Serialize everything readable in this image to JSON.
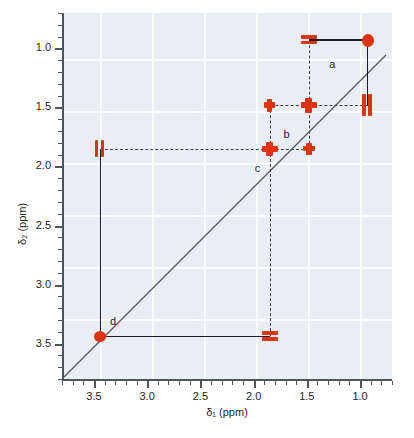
{
  "figure": {
    "type": "cosy-2d-nmr-spectrum",
    "xlabel": "δ₁ (ppm)",
    "ylabel": "δ₂ (ppm)",
    "colors": {
      "peak": "#dd3311",
      "background": "#e9eef4",
      "grid": "#fbfcfe",
      "axis": "#4d545b",
      "line": "#1b1b27"
    }
  },
  "axes": {
    "x": {
      "label": "δ₁ (ppm)",
      "min": 3.8,
      "max": 0.7,
      "inverted": true,
      "ticks": [
        "3.5",
        "3.0",
        "2.5",
        "2.0",
        "1.5",
        "1.0"
      ],
      "tick_values": [
        3.5,
        3.0,
        2.5,
        2.0,
        1.5,
        1.0
      ],
      "minor_step": 0.1
    },
    "y": {
      "label": "δ₂ (ppm)",
      "min": 0.7,
      "max": 3.8,
      "inverted": true,
      "ticks": [
        "1.0",
        "1.5",
        "2.0",
        "2.5",
        "3.0",
        "3.5"
      ],
      "tick_values": [
        1.0,
        1.5,
        2.0,
        2.5,
        3.0,
        3.5
      ],
      "minor_step": 0.1
    }
  },
  "chart_data": {
    "type": "scatter",
    "title": "",
    "xlabel": "δ₁ (ppm)",
    "ylabel": "δ₂ (ppm)",
    "xlim": [
      3.8,
      0.7
    ],
    "ylim": [
      0.7,
      3.8
    ],
    "grid": true,
    "legend": "none",
    "diagonal_line": true,
    "diagonal_from": [
      3.8,
      3.8
    ],
    "diagonal_to": [
      0.7,
      0.7
    ],
    "diagonal_peaks": [
      {
        "id": "dp-093",
        "x": 0.93,
        "y": 0.93,
        "shape": "blob",
        "w": 12,
        "h": 13
      },
      {
        "id": "dp-148",
        "x": 1.48,
        "y": 1.48,
        "shape": "star",
        "w": 16,
        "h": 15
      },
      {
        "id": "dp-185",
        "x": 1.85,
        "y": 1.85,
        "shape": "star",
        "w": 16,
        "h": 14
      },
      {
        "id": "dp-344",
        "x": 3.44,
        "y": 3.44,
        "shape": "blob",
        "w": 12,
        "h": 11
      }
    ],
    "cross_peaks": [
      {
        "id": "cp-148-093",
        "x": 1.48,
        "y": 0.93,
        "shape": "bars-h",
        "w": 16,
        "h": 10
      },
      {
        "id": "cp-093-148",
        "x": 0.93,
        "y": 1.48,
        "shape": "bars-v",
        "w": 11,
        "h": 22
      },
      {
        "id": "cp-185-148",
        "x": 1.85,
        "y": 1.48,
        "shape": "star-sm",
        "w": 11,
        "h": 13
      },
      {
        "id": "cp-148-185",
        "x": 1.48,
        "y": 1.85,
        "shape": "star-sm",
        "w": 12,
        "h": 12
      },
      {
        "id": "cp-344-185",
        "x": 3.44,
        "y": 1.85,
        "shape": "bars-v",
        "w": 11,
        "h": 17
      },
      {
        "id": "cp-185-344",
        "x": 1.85,
        "y": 3.44,
        "shape": "bars-h",
        "w": 16,
        "h": 10
      }
    ],
    "couplings": [
      {
        "label": "a",
        "between": [
          0.93,
          1.48
        ],
        "label_x": 1.29,
        "label_y": 1.08
      },
      {
        "label": "b",
        "between": [
          1.48,
          1.85
        ],
        "label_x": 1.72,
        "label_y": 1.67
      },
      {
        "label": "c",
        "between": [
          1.85,
          1.85
        ],
        "label_x": 1.99,
        "label_y": 1.96
      },
      {
        "label": "d",
        "between": [
          1.85,
          3.44
        ],
        "label_x": 3.35,
        "label_y": 3.26
      }
    ],
    "solid_connectors": [
      {
        "id": "a-horizontal",
        "x1": 1.48,
        "x2": 0.93,
        "y": 0.93,
        "orient": "h"
      },
      {
        "id": "a-vertical",
        "y1": 0.93,
        "y2": 1.48,
        "x": 0.93,
        "orient": "v"
      },
      {
        "id": "d-vertical",
        "y1": 1.85,
        "y2": 3.44,
        "x": 3.44,
        "orient": "v"
      },
      {
        "id": "d-horizontal",
        "x1": 3.44,
        "x2": 1.85,
        "y": 3.44,
        "orient": "h"
      }
    ],
    "dashed_connectors": [
      {
        "id": "g-093-148-v",
        "x": 1.48,
        "y1": 0.93,
        "y2": 1.48,
        "orient": "v"
      },
      {
        "id": "g-148-093-h",
        "y": 1.48,
        "x1": 1.48,
        "x2": 0.93,
        "orient": "h"
      },
      {
        "id": "g-185-148-h",
        "y": 1.48,
        "x1": 1.85,
        "x2": 1.48,
        "orient": "h"
      },
      {
        "id": "g-185-v",
        "x": 1.85,
        "y1": 1.48,
        "y2": 1.85,
        "orient": "v"
      },
      {
        "id": "g-185-h",
        "y": 1.85,
        "x1": 3.44,
        "x2": 1.48,
        "orient": "h"
      },
      {
        "id": "g-185-344-v",
        "x": 1.85,
        "y1": 1.85,
        "y2": 3.44,
        "orient": "v"
      },
      {
        "id": "g-148-185-v",
        "x": 1.48,
        "y1": 1.48,
        "y2": 1.85,
        "orient": "v"
      }
    ]
  },
  "labels": {
    "a": "a",
    "b": "b",
    "c": "c",
    "d": "d"
  }
}
